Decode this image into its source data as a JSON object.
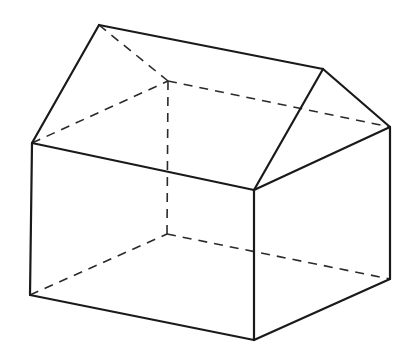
{
  "diagram": {
    "colors": {
      "background": "#ffffff",
      "line": "#1a1a1a"
    },
    "vertices": {
      "A": [
        99,
        25
      ],
      "B": [
        323,
        69
      ],
      "C": [
        390,
        127
      ],
      "D": [
        32,
        143
      ],
      "E": [
        254,
        190
      ],
      "H": [
        168,
        81
      ],
      "F": [
        30,
        295
      ],
      "G": [
        254,
        340
      ],
      "K": [
        390,
        279
      ],
      "L": [
        167,
        234
      ]
    },
    "solid_edges": [
      [
        "A",
        "B"
      ],
      [
        "A",
        "D"
      ],
      [
        "B",
        "E"
      ],
      [
        "B",
        "C"
      ],
      [
        "D",
        "E"
      ],
      [
        "E",
        "C"
      ],
      [
        "D",
        "F"
      ],
      [
        "F",
        "G"
      ],
      [
        "G",
        "K"
      ],
      [
        "E",
        "G"
      ],
      [
        "C",
        "K"
      ]
    ],
    "hidden_edges": [
      [
        "A",
        "H"
      ],
      [
        "H",
        "C"
      ],
      [
        "D",
        "H"
      ],
      [
        "H",
        "L"
      ],
      [
        "F",
        "L"
      ],
      [
        "L",
        "K"
      ]
    ]
  }
}
